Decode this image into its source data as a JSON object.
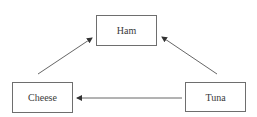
{
  "diagram": {
    "type": "directed-graph",
    "colors": {
      "edge": "#555555",
      "node_border": "#6e6e6e",
      "text": "#3a3a3a",
      "background": "#ffffff"
    },
    "nodes": [
      {
        "id": "ham",
        "label": "Ham"
      },
      {
        "id": "cheese",
        "label": "Cheese"
      },
      {
        "id": "tuna",
        "label": "Tuna"
      }
    ],
    "edges": [
      {
        "from": "cheese",
        "to": "ham"
      },
      {
        "from": "tuna",
        "to": "ham"
      },
      {
        "from": "tuna",
        "to": "cheese"
      }
    ]
  }
}
